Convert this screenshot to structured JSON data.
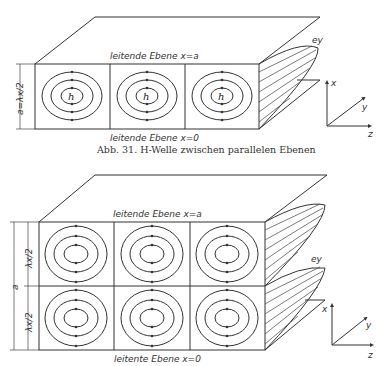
{
  "figure1": {
    "top_label": "leitende Ebene x=a",
    "bottom_label": "leitende Ebene x=0",
    "height_label": "a=λx/2",
    "cell_label": "h",
    "field_label": "ey",
    "caption": "Abb. 31. H-Welle zwischen parallelen Ebenen",
    "axes": {
      "x": "x",
      "y": "y",
      "z": "z"
    }
  },
  "figure2": {
    "top_label": "leitende Ebene x=a",
    "bottom_label": "leitente Ebene x=0",
    "height_label": "a",
    "half_label_upper": "λx/2",
    "half_label_lower": "λx/2",
    "field_label": "ey",
    "axes": {
      "x": "x",
      "y": "y",
      "z": "z"
    }
  }
}
